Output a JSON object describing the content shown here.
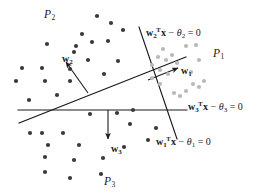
{
  "figure": {
    "kind": "linear-separating-hyperplanes-diagram",
    "width": 266,
    "height": 194,
    "background": "#ffffff"
  },
  "colors": {
    "line": "#1a1a1a",
    "text": "#1a1a1a",
    "dot_dark": "#3a3a3a",
    "dot_light": "#b9b9b9",
    "background": "#ffffff"
  },
  "region_labels": [
    {
      "name": "region-label-p2",
      "base": "P",
      "sub": "2",
      "x": 44,
      "y": 9
    },
    {
      "name": "region-label-p1",
      "base": "P",
      "sub": "1",
      "x": 213,
      "y": 48
    },
    {
      "name": "region-label-p3",
      "base": "P",
      "sub": "3",
      "x": 104,
      "y": 176
    }
  ],
  "vector_labels": [
    {
      "name": "vector-label-w2",
      "base": "w",
      "sub": "2",
      "x": 62,
      "y": 54
    },
    {
      "name": "vector-label-w1",
      "base": "w",
      "sub": "1",
      "x": 181,
      "y": 66
    },
    {
      "name": "vector-label-w3",
      "base": "w",
      "sub": "3",
      "x": 111,
      "y": 144
    }
  ],
  "equation_labels": [
    {
      "name": "equation-w2",
      "vector": "w",
      "vector_sub": "2",
      "transpose": "T",
      "variable": "x",
      "operator": " − ",
      "theta": "θ",
      "theta_sub": "2",
      "equals": " = 0",
      "text": "w2Tx − θ2 = 0",
      "x": 146,
      "y": 28
    },
    {
      "name": "equation-w3",
      "vector": "w",
      "vector_sub": "3",
      "transpose": "T",
      "variable": "x",
      "operator": " − ",
      "theta": "θ",
      "theta_sub": "3",
      "equals": " = 0",
      "text": "w3Tx − θ3 = 0",
      "x": 188,
      "y": 102
    },
    {
      "name": "equation-w1",
      "vector": "w",
      "vector_sub": "1",
      "transpose": "T",
      "variable": "x",
      "operator": " − ",
      "theta": "θ",
      "theta_sub": "1",
      "equals": " = 0",
      "text": "w1Tx − θ1 = 0",
      "x": 156,
      "y": 137
    }
  ],
  "chart_data": {
    "type": "scatter",
    "title": "",
    "xlabel": "",
    "ylabel": "",
    "grid": false,
    "legend": false,
    "boundaries": [
      {
        "label": "w2Tx − θ2 = 0",
        "role": "diagonal-hyperplane",
        "x1": 19,
        "y1": 123,
        "x2": 186,
        "y2": 57,
        "normal_vector": "w2"
      },
      {
        "label": "w3Tx − θ3 = 0",
        "role": "horizontal-hyperplane",
        "x1": 18,
        "y1": 110,
        "x2": 187,
        "y2": 110,
        "normal_vector": "w3"
      },
      {
        "label": "w1Tx − θ1 = 0",
        "role": "steep-hyperplane",
        "x1": 139,
        "y1": 27,
        "x2": 177,
        "y2": 139,
        "normal_vector": "w1"
      }
    ],
    "normals": [
      {
        "name": "w2",
        "tail_x": 88,
        "tail_y": 93,
        "head_x": 66,
        "head_y": 62,
        "points": "away from diagonal boundary into region P2"
      },
      {
        "name": "w1",
        "tail_x": 148,
        "tail_y": 80,
        "head_x": 178,
        "head_y": 68,
        "points": "away from steep boundary into region P1"
      },
      {
        "name": "w3",
        "tail_x": 108,
        "tail_y": 110,
        "head_x": 108,
        "head_y": 139,
        "points": "downward from horizontal boundary into region P3"
      }
    ],
    "series": [
      {
        "name": "region-P2-points",
        "color": "#3a3a3a",
        "marker": "filled-circle",
        "radius": 2.1,
        "points": [
          [
            97,
            16
          ],
          [
            111,
            23
          ],
          [
            82,
            34
          ],
          [
            123,
            30
          ],
          [
            92,
            42
          ],
          [
            108,
            41
          ],
          [
            47,
            44
          ],
          [
            74,
            52
          ],
          [
            76,
            46
          ],
          [
            22,
            68
          ],
          [
            42,
            68
          ],
          [
            88,
            60
          ],
          [
            70,
            69
          ],
          [
            16,
            81
          ],
          [
            45,
            81
          ],
          [
            70,
            81
          ],
          [
            104,
            74
          ],
          [
            118,
            61
          ],
          [
            57,
            95
          ],
          [
            29,
            100
          ]
        ]
      },
      {
        "name": "region-P3-points",
        "color": "#3a3a3a",
        "marker": "filled-circle",
        "radius": 2.1,
        "points": [
          [
            90,
            114
          ],
          [
            117,
            113
          ],
          [
            130,
            124
          ],
          [
            30,
            133
          ],
          [
            42,
            133
          ],
          [
            63,
            133
          ],
          [
            48,
            145
          ],
          [
            79,
            145
          ],
          [
            124,
            147
          ],
          [
            45,
            157
          ],
          [
            74,
            160
          ],
          [
            103,
            158
          ],
          [
            45,
            172
          ],
          [
            70,
            178
          ],
          [
            101,
            174
          ],
          [
            156,
            128
          ],
          [
            148,
            140
          ],
          [
            133,
            110
          ]
        ]
      },
      {
        "name": "region-P1-points",
        "color": "#b9b9b9",
        "marker": "filled-circle",
        "radius": 2.1,
        "points": [
          [
            163,
            49
          ],
          [
            186,
            46
          ],
          [
            158,
            57
          ],
          [
            166,
            60
          ],
          [
            172,
            55
          ],
          [
            152,
            65
          ],
          [
            177,
            63
          ],
          [
            160,
            70
          ],
          [
            168,
            74
          ],
          [
            196,
            45
          ],
          [
            199,
            60
          ],
          [
            193,
            84
          ],
          [
            199,
            87
          ],
          [
            204,
            81
          ],
          [
            174,
            93
          ],
          [
            180,
            96
          ],
          [
            186,
            91
          ],
          [
            160,
            84
          ],
          [
            152,
            78
          ],
          [
            191,
            72
          ]
        ]
      }
    ]
  }
}
